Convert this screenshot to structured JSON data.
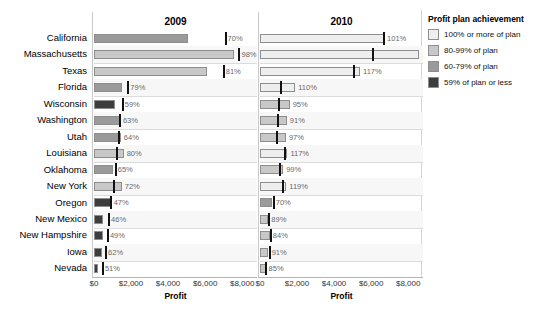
{
  "chart_data": {
    "type": "bar",
    "title": "",
    "xlabel": "Profit",
    "ylabel": "",
    "xlim": [
      0,
      8800
    ],
    "xticks": [
      0,
      2000,
      4000,
      6000,
      8000
    ],
    "xtick_labels": [
      "$0",
      "$2,000",
      "$4,000",
      "$6,000",
      "$8,000"
    ],
    "grid": true,
    "legend_position": "right",
    "panels": [
      "2009",
      "2010"
    ],
    "categories": [
      "California",
      "Massachusetts",
      "Texas",
      "Florida",
      "Wisconsin",
      "Washington",
      "Utah",
      "Louisiana",
      "Oklahoma",
      "New York",
      "Oregon",
      "New Mexico",
      "New Hampshire",
      "Iowa",
      "Nevada"
    ],
    "series": [
      {
        "name": "2009",
        "values": [
          5100,
          7550,
          6100,
          1500,
          1150,
          1400,
          1450,
          1600,
          1050,
          1500,
          900,
          500,
          500,
          420,
          230
        ],
        "targets": [
          7050,
          7800,
          6950,
          1800,
          1500,
          1350,
          1300,
          1180,
          1120,
          1000,
          880,
          760,
          700,
          600,
          430
        ],
        "labels": [
          "70%",
          "98%",
          "81%",
          "79%",
          "59%",
          "63%",
          "64%",
          "80%",
          "65%",
          "72%",
          "47%",
          "46%",
          "49%",
          "62%",
          "51%"
        ],
        "bands": [
          "60-79",
          "80-99",
          "80-99",
          "60-79",
          "59-",
          "60-79",
          "60-79",
          "80-99",
          "60-79",
          "80-99",
          "59-",
          "59-",
          "59-",
          "59-",
          "59-"
        ]
      },
      {
        "name": "2010",
        "values": [
          6700,
          8600,
          5400,
          1900,
          1600,
          1450,
          1400,
          1480,
          1250,
          1420,
          650,
          430,
          520,
          450,
          300
        ],
        "targets": [
          6620,
          6050,
          5000,
          1080,
          960,
          900,
          880,
          1280,
          1030,
          1200,
          690,
          450,
          530,
          470,
          260
        ],
        "labels": [
          "101%",
          "142%",
          "117%",
          "110%",
          "95%",
          "91%",
          "97%",
          "117%",
          "99%",
          "119%",
          "70%",
          "89%",
          "84%",
          "91%",
          "85%"
        ],
        "bands": [
          "100+",
          "100+",
          "100+",
          "100+",
          "80-99",
          "80-99",
          "80-99",
          "100+",
          "80-99",
          "100+",
          "60-79",
          "80-99",
          "80-99",
          "80-99",
          "80-99"
        ]
      }
    ]
  },
  "legend": {
    "title": "Profit plan achievement",
    "items": [
      {
        "key": "100+",
        "label": "100% or more of plan",
        "color": "#eeeeee"
      },
      {
        "key": "80-99",
        "label": "80-99% of plan",
        "color": "#c8c8c8"
      },
      {
        "key": "60-79",
        "label": "60-79% of plan",
        "color": "#9a9a9a"
      },
      {
        "key": "59-",
        "label": "59% of plan or less",
        "color": "#3d3d3d"
      }
    ]
  }
}
